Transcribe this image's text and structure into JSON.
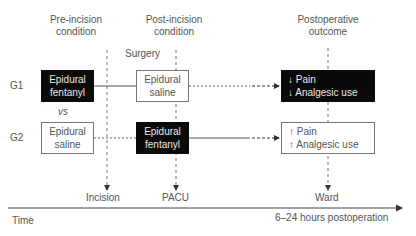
{
  "headers": {
    "pre_incision": "Pre-incision\ncondition",
    "pre_incision_l1": "Pre-incision",
    "pre_incision_l2": "condition",
    "post_incision_l1": "Post-incision",
    "post_incision_l2": "condition",
    "outcome_l1": "Postoperative",
    "outcome_l2": "outcome",
    "surgery": "Surgery"
  },
  "groups": [
    {
      "label": "G1",
      "pre": {
        "line1": "Epidural",
        "line2": "fentanyl",
        "style": "black"
      },
      "post": {
        "line1": "Epidural",
        "line2": "saline",
        "style": "white"
      },
      "outcome": {
        "line1": "↓ Pain",
        "line2": "↓ Analgesic use",
        "style": "black"
      }
    },
    {
      "label": "G2",
      "pre": {
        "line1": "Epidural",
        "line2": "saline",
        "style": "white"
      },
      "post": {
        "line1": "Epidural",
        "line2": "fentanyl",
        "style": "black"
      },
      "outcome": {
        "line1": "↑ Pain",
        "line2": "↑ Analgesic use",
        "style": "white"
      }
    }
  ],
  "vs_label": "vs",
  "timepoints": {
    "incision": "Incision",
    "pacu": "PACU",
    "ward": "Ward"
  },
  "time_axis": {
    "label": "Time",
    "end_label": "6–24 hours postoperation"
  }
}
